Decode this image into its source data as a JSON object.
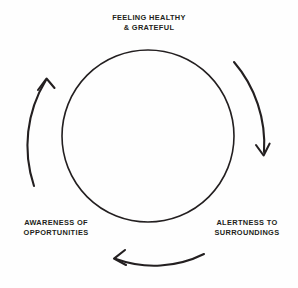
{
  "diagram": {
    "type": "cycle",
    "title_visible": false,
    "direction": "clockwise",
    "colors": {
      "stroke": "#231f20",
      "text": "#231f20",
      "background": "#fefefe"
    },
    "circle": {
      "center_x": 148,
      "center_y": 136,
      "radius": 86,
      "stroke_width": 1.6
    },
    "arrows": [
      {
        "name": "arrow-top-right",
        "from_stage": "FEELING HEALTHY & GRATEFUL",
        "to_stage": "ALERTNESS TO SURROUNDINGS",
        "head_direction": "down"
      },
      {
        "name": "arrow-bottom",
        "from_stage": "ALERTNESS TO SURROUNDINGS",
        "to_stage": "AWARENESS OF OPPORTUNITIES",
        "head_direction": "left"
      },
      {
        "name": "arrow-top-left",
        "from_stage": "AWARENESS OF OPPORTUNITIES",
        "to_stage": "FEELING HEALTHY & GRATEFUL",
        "head_direction": "up"
      }
    ],
    "labels": {
      "top": {
        "line1": "FEELING HEALTHY",
        "line2": "& GRATEFUL"
      },
      "left": {
        "line1": "AWARENESS OF",
        "line2": "OPPORTUNITIES"
      },
      "right": {
        "line1": "ALERTNESS TO",
        "line2": "SURROUNDINGS"
      }
    }
  }
}
